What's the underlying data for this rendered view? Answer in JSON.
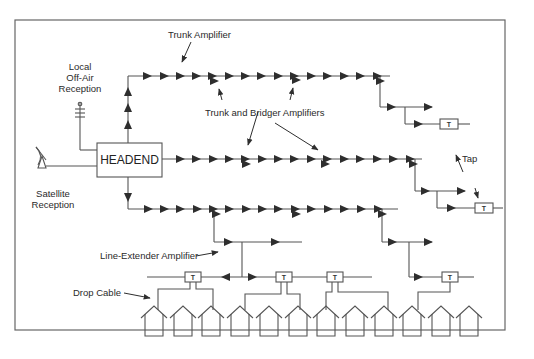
{
  "diagram": {
    "headend": {
      "label": "HEADEND"
    },
    "labels": {
      "trunk_amplifier": "Trunk Amplifier",
      "local_reception_line1": "Local",
      "local_reception_line2": "Off-Air",
      "local_reception_line3": "Reception",
      "trunk_bridger": "Trunk and Bridger Amplifiers",
      "satellite_line1": "Satellite",
      "satellite_line2": "Reception",
      "tap": "Tap",
      "line_extender": "Line-Extender Amplifier",
      "drop_cable": "Drop Cable"
    },
    "tap_symbol": "T",
    "components": {
      "trunk_lines": 3,
      "taps": 6,
      "houses": 15
    },
    "colors": {
      "line": "#555555",
      "arrow": "#2e2e2e",
      "frame": "#666666",
      "text": "#2a2a2a"
    }
  }
}
